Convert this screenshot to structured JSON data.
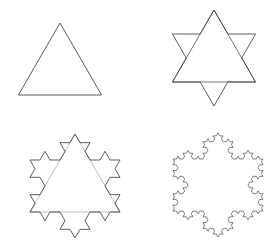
{
  "figure": {
    "width": 273,
    "height": 245,
    "background_color": "#ffffff",
    "stroke_color": "#4a4a4a",
    "panel_layout": "2x2 grid of fractal stages, no captions, no axes, no labels",
    "panels": [
      {
        "name": "stage-0-triangle",
        "iteration": 0,
        "shape": "equilateral-triangle",
        "segment_count": 3,
        "center_x": 60,
        "center_y": 71,
        "radius": 48,
        "rotation_deg": -90,
        "description": "Plain equilateral triangle, apex up, flat base"
      },
      {
        "name": "stage-1-hexagram",
        "iteration": 1,
        "shape": "koch-iteration-1-star-of-david",
        "segment_count": 12,
        "center_x": 214,
        "center_y": 58,
        "radius": 48,
        "rotation_deg": -90,
        "description": "Six-pointed star; original triangle chords still drawn across the interior",
        "show_construction_lines": true
      },
      {
        "name": "stage-2-snowflake",
        "iteration": 2,
        "shape": "koch-iteration-2",
        "segment_count": 48,
        "center_x": 75,
        "center_y": 186,
        "radius": 52,
        "rotation_deg": -90,
        "description": "Second-order Koch snowflake with twelve large spikes and smaller bumps",
        "show_construction_lines": true
      },
      {
        "name": "stage-3-snowflake",
        "iteration": 3,
        "shape": "koch-iteration-3",
        "segment_count": 192,
        "center_x": 218,
        "center_y": 185,
        "radius": 52,
        "rotation_deg": -90,
        "description": "Third-order Koch snowflake, finely crenellated outline",
        "show_construction_lines": false
      }
    ]
  }
}
